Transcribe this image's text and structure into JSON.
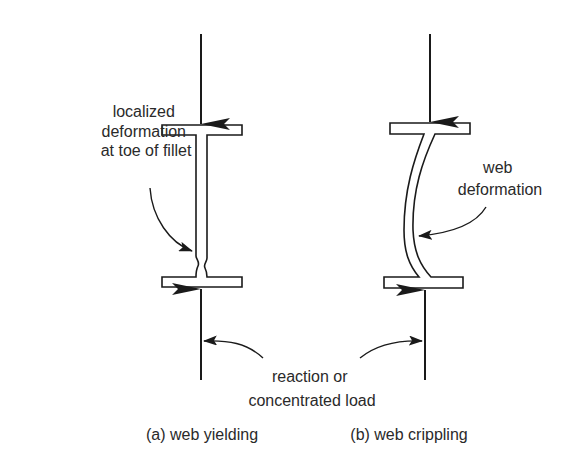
{
  "figure": {
    "panels": [
      {
        "id": "a",
        "caption": "(a) web yielding",
        "annotation_lines": [
          "localized",
          "deformation",
          "at toe of fillet"
        ]
      },
      {
        "id": "b",
        "caption": "(b) web crippling",
        "annotation_lines": [
          "web",
          "deformation"
        ]
      }
    ],
    "shared_label_lines": [
      "reaction or",
      "concentrated load"
    ],
    "colors": {
      "line": "#1a1a1a",
      "text": "#2a2a2a",
      "background": "#ffffff"
    }
  }
}
